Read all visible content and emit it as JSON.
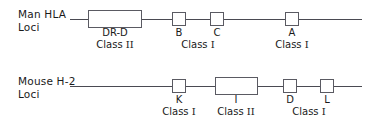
{
  "figure": {
    "type": "genetic-map-diagram",
    "background_color": "#ffffff",
    "line_color": "#4a4a52",
    "box_border_color": "#5a5a62",
    "text_color": "#1a1a1a"
  },
  "rows": [
    {
      "id": "man-hla",
      "label_line1": "Man HLA",
      "label_line2": "Loci",
      "line": {
        "x1": 70,
        "x2": 362,
        "y": 19
      },
      "loci": [
        {
          "name": "DR-D",
          "x": 88,
          "width": 54,
          "y": 10,
          "height": 18,
          "center": 115
        },
        {
          "name": "B",
          "x": 172,
          "width": 14,
          "y": 12,
          "height": 14,
          "center": 179
        },
        {
          "name": "C",
          "x": 210,
          "width": 14,
          "y": 12,
          "height": 14,
          "center": 217
        },
        {
          "name": "A",
          "x": 285,
          "width": 14,
          "y": 12,
          "height": 14,
          "center": 292
        }
      ],
      "classes": [
        {
          "text": "Class",
          "numeral": "II",
          "center": 115
        },
        {
          "text": "Class",
          "numeral": "I",
          "center": 198
        },
        {
          "text": "Class",
          "numeral": "I",
          "center": 292
        }
      ]
    },
    {
      "id": "mouse-h2",
      "label_line1": "Mouse H-2",
      "label_line2": "Loci",
      "line": {
        "x1": 70,
        "x2": 362,
        "y": 86
      },
      "loci": [
        {
          "name": "K",
          "x": 172,
          "width": 14,
          "y": 79,
          "height": 14,
          "center": 179
        },
        {
          "name": "I",
          "x": 215,
          "width": 43,
          "y": 77,
          "height": 18,
          "center": 236
        },
        {
          "name": "D",
          "x": 283,
          "width": 14,
          "y": 79,
          "height": 14,
          "center": 290
        },
        {
          "name": "L",
          "x": 320,
          "width": 14,
          "y": 79,
          "height": 14,
          "center": 327
        }
      ],
      "classes": [
        {
          "text": "Class",
          "numeral": "I",
          "center": 179
        },
        {
          "text": "Class",
          "numeral": "II",
          "center": 236
        },
        {
          "text": "Class",
          "numeral": "I",
          "center": 309
        }
      ]
    }
  ]
}
